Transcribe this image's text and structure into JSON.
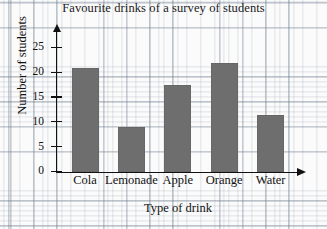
{
  "chart_data": {
    "type": "bar",
    "title": "Favourite drinks of a survey of students",
    "xlabel": "Type of drink",
    "ylabel": "Number of students",
    "categories": [
      "Cola",
      "Lemonade",
      "Apple",
      "Orange",
      "Water"
    ],
    "values": [
      21,
      9,
      17.5,
      22,
      11.5
    ],
    "yticks": [
      "0",
      "5",
      "10",
      "15",
      "20",
      "25"
    ],
    "ytick_values": [
      0,
      5,
      10,
      15,
      20,
      25
    ],
    "ylim": [
      0,
      26.5
    ],
    "grid": true,
    "legend": null,
    "bar_color": "#6e6e6e",
    "axis_color": "#111111",
    "grid_color": "#7a8794",
    "background": "#fbfbfb"
  },
  "axes": {
    "y_title": "Number of students",
    "x_title": "Type of drink",
    "y_arrow": "arrow-up-icon",
    "x_arrow": "arrow-right-icon"
  }
}
